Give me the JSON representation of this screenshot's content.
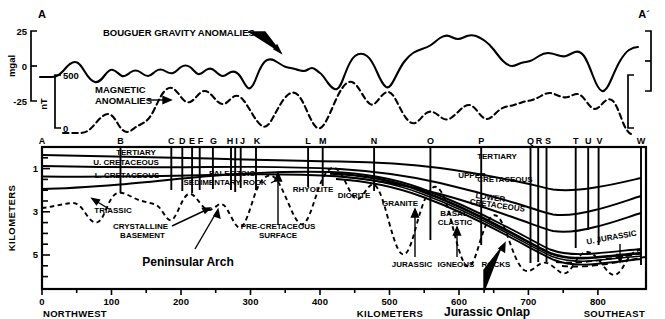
{
  "figure": {
    "section_start_label": "A",
    "section_end_label": "A´"
  },
  "gravity_panel": {
    "curve_label": "BOUGUER GRAVITY ANOMALIES",
    "axis_unit": "mgal",
    "ticks": [
      "25",
      "0",
      "-25"
    ],
    "axis_max": 25,
    "axis_min": -25
  },
  "magnetic_panel": {
    "curve_label_line1": "MAGNETIC",
    "curve_label_line2": "ANOMALIES",
    "axis_unit": "nT",
    "ticks": [
      "500",
      "0"
    ],
    "axis_max": 500,
    "axis_min": 0
  },
  "cross_section": {
    "depth_axis_title": "KILOMETERS",
    "depth_ticks": [
      "1",
      "3",
      "5"
    ],
    "distance_axis_title": "KILOMETERS",
    "distance_ticks": [
      "0",
      "100",
      "200",
      "300",
      "400",
      "500",
      "600",
      "700",
      "800"
    ],
    "direction_left": "NORTHWEST",
    "direction_right": "SOUTHEAST",
    "wells": [
      {
        "id": "A",
        "km": 0
      },
      {
        "id": "B",
        "km": 113
      },
      {
        "id": "C",
        "km": 186
      },
      {
        "id": "D",
        "km": 202
      },
      {
        "id": "E",
        "km": 216
      },
      {
        "id": "F",
        "km": 227
      },
      {
        "id": "G",
        "km": 246
      },
      {
        "id": "H",
        "km": 272
      },
      {
        "id": "I",
        "km": 278
      },
      {
        "id": "J",
        "km": 286
      },
      {
        "id": "K",
        "km": 308
      },
      {
        "id": "L",
        "km": 383
      },
      {
        "id": "M",
        "km": 404
      },
      {
        "id": "N",
        "km": 478
      },
      {
        "id": "O",
        "km": 559
      },
      {
        "id": "P",
        "km": 632
      },
      {
        "id": "Q",
        "km": 703
      },
      {
        "id": "R",
        "km": 714
      },
      {
        "id": "S",
        "km": 726
      },
      {
        "id": "T",
        "km": 768
      },
      {
        "id": "U",
        "km": 786
      },
      {
        "id": "V",
        "km": 801
      },
      {
        "id": "W",
        "km": 862
      }
    ],
    "unit_labels": [
      {
        "text": "TERTIARY",
        "km": 135,
        "depth_km": 0.42
      },
      {
        "text": "U. CRETACEOUS",
        "km": 120,
        "depth_km": 0.97
      },
      {
        "text": "L. CRETACEOUS",
        "km": 122,
        "depth_km": 1.52
      },
      {
        "text": "TRIASSIC",
        "km": 103,
        "depth_km": 2.9
      },
      {
        "text": "PALEOZOIC",
        "km": 273,
        "depth_km": 1.35
      },
      {
        "text": "SEDIMENTARY ROCK",
        "km": 262,
        "depth_km": 1.72
      },
      {
        "text": "RHYOLITE",
        "km": 389,
        "depth_km": 2.07
      },
      {
        "text": "DIORITE",
        "km": 448,
        "depth_km": 2.3
      },
      {
        "text": "GRANITE",
        "km": 500,
        "depth_km": 2.62
      },
      {
        "text": "TERTIARY",
        "km": 653,
        "depth_km": 0.48
      },
      {
        "text": "UPPER",
        "km": 619,
        "depth_km": 1.3
      },
      {
        "text": "CRETACEOUS",
        "km": 666,
        "depth_km": 1.38
      },
      {
        "text": "LOWER",
        "km": 644,
        "depth_km": 2.13
      },
      {
        "text": "CRETACEOUS",
        "km": 651,
        "depth_km": 2.4
      },
      {
        "text": "BASAL",
        "km": 591,
        "depth_km": 2.94
      },
      {
        "text": "CLASTIC",
        "km": 592,
        "depth_km": 3.25
      },
      {
        "text": "U. JURASSIC",
        "km": 824,
        "depth_km": 3.82
      }
    ],
    "annotations": [
      {
        "text": "CRYSTALLINE",
        "km": 183,
        "depth_km": 4.05
      },
      {
        "text": "BASEMENT",
        "km": 180,
        "depth_km": 4.42
      },
      {
        "text": "PRE-CRETACEOUS",
        "km": 330,
        "depth_km": 4.05
      },
      {
        "text": "SURFACE",
        "km": 330,
        "depth_km": 4.42
      },
      {
        "text": "JURASSIC",
        "km": 554,
        "depth_km": 5.25
      },
      {
        "text": "IGNEOUS",
        "km": 616,
        "depth_km": 5.25
      },
      {
        "text": "ROCKS",
        "km": 668,
        "depth_km": 5.25
      }
    ],
    "highlight_annotations": [
      {
        "text": "Peninsular Arch",
        "km": 222,
        "depth_km": 5.25
      },
      {
        "text": "Jurassic Onlap",
        "km": 657,
        "depth_km": 7.1
      }
    ]
  }
}
